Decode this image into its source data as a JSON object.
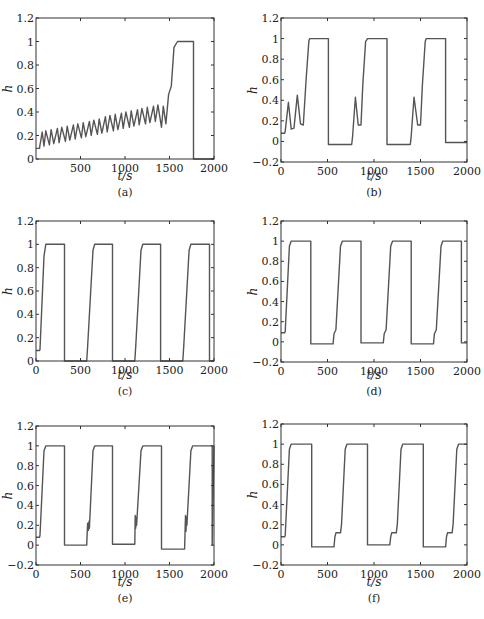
{
  "figure": {
    "panels": [
      {
        "id": "a",
        "caption": "(a)"
      },
      {
        "id": "b",
        "caption": "(b)"
      },
      {
        "id": "c",
        "caption": "(c)"
      },
      {
        "id": "d",
        "caption": "(d)"
      },
      {
        "id": "e",
        "caption": "(e)"
      },
      {
        "id": "f",
        "caption": "(f)"
      }
    ]
  },
  "chart_data": [
    {
      "panel": "(a)",
      "type": "line",
      "xlabel": "t/s",
      "ylabel": "h",
      "xlim": [
        0,
        2000
      ],
      "ylim": [
        0,
        1.2
      ],
      "xticks": [
        500,
        1000,
        1500,
        2000
      ],
      "yticks": [
        0,
        0.2,
        0.4,
        0.6,
        0.8,
        1,
        1.2
      ],
      "ytick_labels": [
        "0",
        "0.2",
        "0.4",
        "0.6",
        "0.8",
        "1",
        "1.2"
      ],
      "grid": false,
      "series": [
        {
          "name": "h",
          "x": [
            0,
            40,
            40,
            70,
            90,
            110,
            150,
            170,
            200,
            240,
            260,
            290,
            330,
            350,
            380,
            420,
            440,
            470,
            510,
            530,
            560,
            600,
            620,
            650,
            690,
            710,
            740,
            780,
            800,
            830,
            870,
            890,
            920,
            960,
            980,
            1010,
            1050,
            1070,
            1100,
            1140,
            1160,
            1190,
            1230,
            1250,
            1280,
            1320,
            1340,
            1370,
            1410,
            1430,
            1460,
            1490,
            1520,
            1550,
            1590,
            1620,
            1770,
            1770,
            2000
          ],
          "y": [
            0.09,
            0.09,
            0.1,
            0.23,
            0.11,
            0.24,
            0.12,
            0.25,
            0.13,
            0.26,
            0.14,
            0.27,
            0.15,
            0.28,
            0.16,
            0.29,
            0.17,
            0.3,
            0.18,
            0.31,
            0.19,
            0.32,
            0.2,
            0.33,
            0.21,
            0.34,
            0.22,
            0.36,
            0.23,
            0.37,
            0.24,
            0.38,
            0.25,
            0.39,
            0.26,
            0.4,
            0.27,
            0.41,
            0.28,
            0.42,
            0.29,
            0.43,
            0.3,
            0.44,
            0.31,
            0.45,
            0.32,
            0.46,
            0.27,
            0.45,
            0.3,
            0.55,
            0.62,
            0.95,
            1,
            1,
            1,
            0,
            0
          ]
        }
      ]
    },
    {
      "panel": "(b)",
      "type": "line",
      "xlabel": "t/s",
      "ylabel": "h",
      "xlim": [
        0,
        2000
      ],
      "ylim": [
        -0.2,
        1.2
      ],
      "xticks": [
        0,
        500,
        1000,
        1500,
        2000
      ],
      "yticks": [
        -0.2,
        0,
        0.2,
        0.4,
        0.6,
        0.8,
        1,
        1.2
      ],
      "ytick_labels": [
        "−0.2",
        "0",
        "0.2",
        "0.4",
        "0.6",
        "0.8",
        "1",
        "1.2"
      ],
      "grid": false,
      "series": [
        {
          "name": "h",
          "x": [
            0,
            40,
            45,
            80,
            110,
            140,
            175,
            210,
            240,
            270,
            300,
            310,
            510,
            510,
            760,
            770,
            800,
            830,
            860,
            880,
            910,
            930,
            1140,
            1140,
            1390,
            1400,
            1430,
            1470,
            1500,
            1520,
            1550,
            1560,
            1770,
            1770,
            2000
          ],
          "y": [
            0.08,
            0.08,
            0.1,
            0.38,
            0.12,
            0.13,
            0.45,
            0.17,
            0.16,
            0.6,
            0.98,
            1,
            1,
            -0.03,
            -0.03,
            0.05,
            0.43,
            0.16,
            0.16,
            0.55,
            0.97,
            1,
            1,
            -0.03,
            -0.03,
            0.05,
            0.43,
            0.16,
            0.16,
            0.55,
            0.97,
            1,
            1,
            -0.01,
            -0.01
          ]
        }
      ]
    },
    {
      "panel": "(c)",
      "type": "line",
      "xlabel": "t/s",
      "ylabel": "h",
      "xlim": [
        0,
        2000
      ],
      "ylim": [
        0,
        1.2
      ],
      "xticks": [
        0,
        500,
        1000,
        1500,
        2000
      ],
      "yticks": [
        0,
        0.2,
        0.4,
        0.6,
        0.8,
        1,
        1.2
      ],
      "ytick_labels": [
        "0",
        "0.2",
        "0.4",
        "0.6",
        "0.8",
        "1",
        "1.2"
      ],
      "grid": false,
      "series": [
        {
          "name": "h",
          "x": [
            0,
            40,
            45,
            90,
            110,
            320,
            320,
            570,
            580,
            640,
            660,
            860,
            860,
            1110,
            1120,
            1180,
            1200,
            1400,
            1400,
            1650,
            1660,
            1720,
            1740,
            1950,
            1950,
            2000
          ],
          "y": [
            0.09,
            0.09,
            0.1,
            0.9,
            1,
            1,
            0,
            0,
            0.12,
            0.95,
            1,
            1,
            0,
            0,
            0.12,
            0.95,
            1,
            1,
            0,
            0,
            0.12,
            0.95,
            1,
            1,
            0,
            0
          ]
        }
      ]
    },
    {
      "panel": "(d)",
      "type": "line",
      "xlabel": "t/s",
      "ylabel": "h",
      "xlim": [
        0,
        2000
      ],
      "ylim": [
        -0.2,
        1.2
      ],
      "xticks": [
        0,
        500,
        1000,
        1500,
        2000
      ],
      "yticks": [
        -0.2,
        0,
        0.2,
        0.4,
        0.6,
        0.8,
        1,
        1.2
      ],
      "ytick_labels": [
        "−0.2",
        "0",
        "0.2",
        "0.4",
        "0.6",
        "0.8",
        "1",
        "1.2"
      ],
      "grid": false,
      "series": [
        {
          "name": "h",
          "x": [
            0,
            40,
            45,
            90,
            110,
            320,
            320,
            560,
            570,
            590,
            640,
            660,
            860,
            860,
            1100,
            1110,
            1130,
            1180,
            1200,
            1400,
            1400,
            1640,
            1650,
            1670,
            1720,
            1740,
            1940,
            1940,
            2000
          ],
          "y": [
            0.09,
            0.09,
            0.1,
            0.95,
            1,
            1,
            -0.02,
            -0.02,
            0.08,
            0.12,
            0.95,
            1,
            1,
            -0.01,
            -0.01,
            0.08,
            0.12,
            0.95,
            1,
            1,
            -0.02,
            -0.02,
            0.08,
            0.12,
            0.95,
            1,
            1,
            -0.01,
            -0.01
          ]
        }
      ]
    },
    {
      "panel": "(e)",
      "type": "line",
      "xlabel": "t/s",
      "ylabel": "h",
      "xlim": [
        0,
        2000
      ],
      "ylim": [
        -0.2,
        1.2
      ],
      "xticks": [
        0,
        500,
        1000,
        1500,
        2000
      ],
      "yticks": [
        -0.2,
        0,
        0.2,
        0.4,
        0.6,
        0.8,
        1,
        1.2
      ],
      "ytick_labels": [
        "−0.2",
        "0",
        "0.2",
        "0.4",
        "0.6",
        "0.8",
        "1",
        "1.2"
      ],
      "grid": false,
      "series": [
        {
          "name": "h",
          "x": [
            0,
            40,
            45,
            90,
            110,
            320,
            320,
            570,
            580,
            590,
            595,
            600,
            640,
            660,
            860,
            860,
            1110,
            1115,
            1120,
            1125,
            1130,
            1180,
            1200,
            1410,
            1410,
            1670,
            1680,
            1685,
            1690,
            1695,
            1740,
            1760,
            1980,
            1980,
            2000
          ],
          "y": [
            0.08,
            0.08,
            0.1,
            0.95,
            1,
            1,
            0,
            0,
            0.22,
            0.15,
            0.24,
            0.17,
            0.95,
            1,
            1,
            0.01,
            0.01,
            0.3,
            0.17,
            0.28,
            0.2,
            0.95,
            1,
            1,
            -0.04,
            -0.04,
            0.3,
            0.14,
            0.28,
            0.2,
            0.95,
            1,
            1,
            0,
            1
          ]
        }
      ]
    },
    {
      "panel": "(f)",
      "type": "line",
      "xlabel": "t/s",
      "ylabel": "h",
      "xlim": [
        0,
        2000
      ],
      "ylim": [
        -0.2,
        1.2
      ],
      "xticks": [
        0,
        500,
        1000,
        1500,
        2000
      ],
      "yticks": [
        -0.2,
        0,
        0.2,
        0.4,
        0.6,
        0.8,
        1,
        1.2
      ],
      "ytick_labels": [
        "−0.2",
        "0",
        "0.2",
        "0.4",
        "0.6",
        "0.8",
        "1",
        "1.2"
      ],
      "grid": false,
      "series": [
        {
          "name": "h",
          "x": [
            0,
            40,
            45,
            90,
            110,
            330,
            330,
            570,
            580,
            590,
            640,
            650,
            690,
            710,
            930,
            930,
            1170,
            1180,
            1190,
            1240,
            1250,
            1290,
            1310,
            1530,
            1530,
            1770,
            1780,
            1790,
            1840,
            1850,
            1890,
            1910,
            2000
          ],
          "y": [
            0.08,
            0.08,
            0.09,
            0.95,
            1,
            1,
            -0.02,
            -0.02,
            0.08,
            0.12,
            0.12,
            0.2,
            0.95,
            1,
            1,
            0,
            0,
            0.08,
            0.12,
            0.12,
            0.2,
            0.95,
            1,
            1,
            -0.02,
            -0.02,
            0.08,
            0.12,
            0.12,
            0.2,
            0.95,
            1,
            1
          ]
        }
      ]
    }
  ]
}
